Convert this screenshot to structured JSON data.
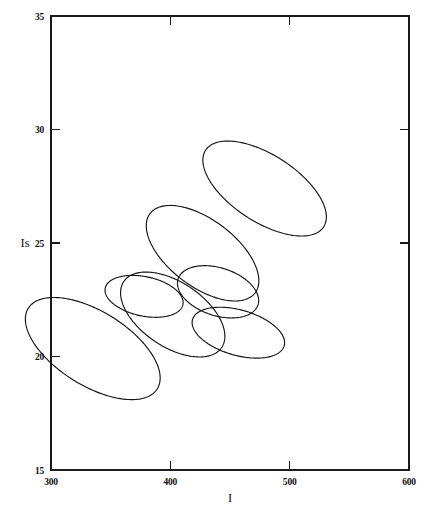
{
  "chart_data": {
    "type": "scatter",
    "subtype": "confidence-ellipses",
    "title": "",
    "xlabel": "I",
    "ylabel": "Is",
    "xlim": [
      300,
      600
    ],
    "ylim": [
      15,
      35
    ],
    "xticks": [
      300,
      400,
      500,
      600
    ],
    "xtick_labels": [
      "300",
      "400",
      "500",
      "600"
    ],
    "yticks": [
      15,
      20,
      25,
      30,
      35
    ],
    "ytick_labels": [
      "15",
      "20",
      "25",
      "30",
      "35"
    ],
    "grid": false,
    "legend": null,
    "right_axis_ticks": [
      25,
      30
    ],
    "top_axis_ticks": [],
    "frame": "box",
    "ellipses": [
      {
        "name": "ellipse-1",
        "cx": 335,
        "cy": 20.35,
        "rx": 31,
        "ry": 3.35,
        "angle": 58
      },
      {
        "name": "ellipse-2",
        "cx": 378,
        "cy": 22.65,
        "rx": 16.5,
        "ry": 1.75,
        "angle": 78
      },
      {
        "name": "ellipse-3",
        "cx": 402,
        "cy": 21.85,
        "rx": 27,
        "ry": 2.6,
        "angle": 56
      },
      {
        "name": "ellipse-4",
        "cx": 427,
        "cy": 24.55,
        "rx": 28,
        "ry": 2.9,
        "angle": 53
      },
      {
        "name": "ellipse-5",
        "cx": 440,
        "cy": 22.85,
        "rx": 20,
        "ry": 1.85,
        "angle": 72
      },
      {
        "name": "ellipse-6",
        "cx": 457,
        "cy": 21.05,
        "rx": 19,
        "ry": 2.1,
        "angle": 74
      },
      {
        "name": "ellipse-7",
        "cx": 479,
        "cy": 27.4,
        "rx": 28,
        "ry": 3.1,
        "angle": 57
      }
    ]
  },
  "axes": {
    "x_title": "I",
    "y_title": "Is",
    "x_tick_labels": [
      "300",
      "400",
      "500",
      "600"
    ],
    "y_tick_labels": [
      "35",
      "30",
      "25",
      "20",
      "15"
    ]
  },
  "colors": {
    "ink": "#141414",
    "background": "#ffffff"
  }
}
